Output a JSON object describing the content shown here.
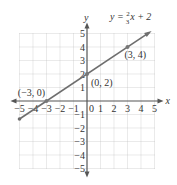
{
  "chart_data": {
    "type": "line",
    "title": "",
    "equation": {
      "prefix": "y = ",
      "num": "2",
      "den": "3",
      "suffix": "x + 2"
    },
    "xlabel": "x",
    "ylabel": "y",
    "xlim": [
      -5,
      5
    ],
    "ylim": [
      -5,
      5
    ],
    "grid": true,
    "x_ticks": [
      "-5",
      "-4",
      "-3",
      "-2",
      "-1",
      "1",
      "2",
      "3",
      "4",
      "5"
    ],
    "y_ticks": [
      "5",
      "4",
      "3",
      "2",
      "1",
      "-1",
      "-2",
      "-3",
      "-4",
      "-5"
    ],
    "origin_label": "0",
    "line": {
      "slope": 0.6667,
      "intercept": 2,
      "x_start": -5,
      "x_end": 4.6,
      "color": "#6e6e6e"
    },
    "points": [
      {
        "x": -3,
        "y": 0,
        "label": "(−3, 0)"
      },
      {
        "x": 0,
        "y": 2,
        "label": "(0, 2)"
      },
      {
        "x": 3,
        "y": 4,
        "label": "(3, 4)"
      }
    ]
  }
}
